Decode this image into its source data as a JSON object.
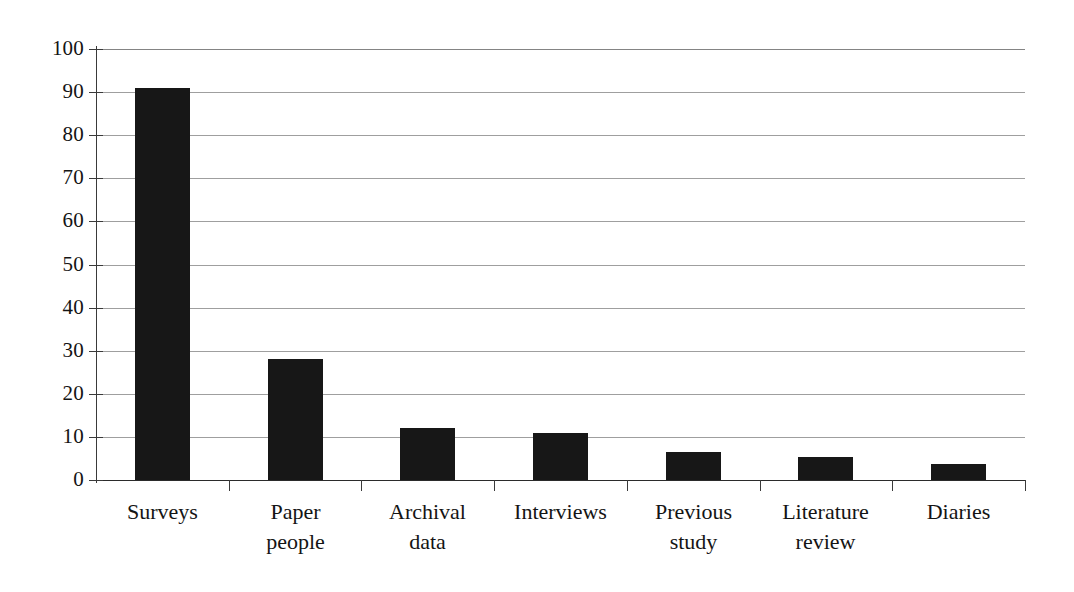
{
  "chart_data": {
    "type": "bar",
    "title": "",
    "subtitle": "",
    "xlabel": "",
    "ylabel": "",
    "categories": [
      "Surveys",
      "Paper people",
      "Archival data",
      "Interviews",
      "Previous study",
      "Literature review",
      "Diaries"
    ],
    "category_lines": [
      [
        "Surveys"
      ],
      [
        "Paper",
        "people"
      ],
      [
        "Archival",
        "data"
      ],
      [
        "Interviews"
      ],
      [
        "Previous",
        "study"
      ],
      [
        "Literature",
        "review"
      ],
      [
        "Diaries"
      ]
    ],
    "values": [
      91,
      28,
      12,
      11,
      6.5,
      5.3,
      3.7
    ],
    "ylim": [
      0,
      100
    ],
    "ytick_labels": [
      "100",
      "90",
      "80",
      "70",
      "60",
      "50",
      "40",
      "30",
      "20",
      "10",
      "0"
    ],
    "ytick_values": [
      100,
      90,
      80,
      70,
      60,
      50,
      40,
      30,
      20,
      10,
      0
    ],
    "grid": true,
    "grid_axis": "y",
    "legend": false,
    "legend_position": "none",
    "bar_color": "#171717",
    "grid_color": "#8e8e8e",
    "axis_color": "#3a3a3a",
    "background_color": "#ffffff"
  }
}
